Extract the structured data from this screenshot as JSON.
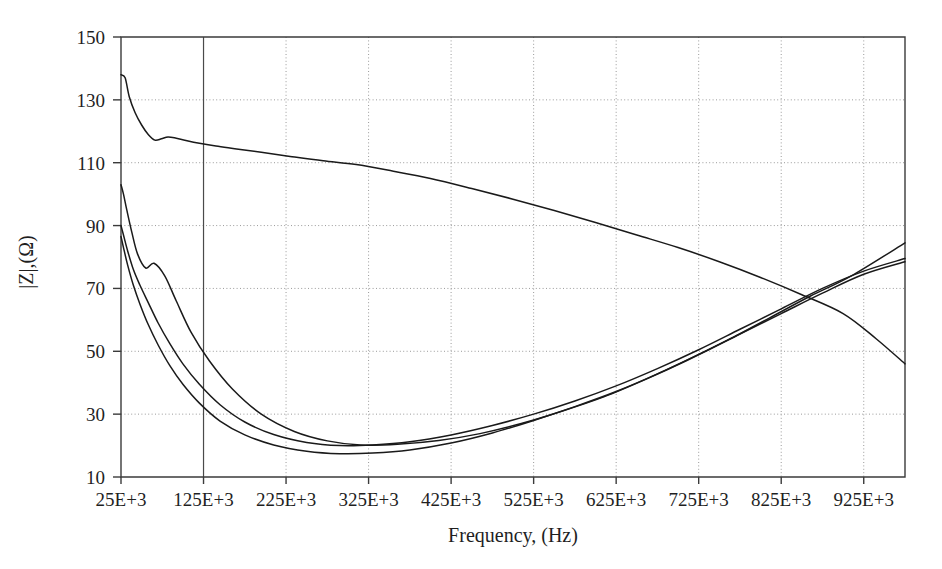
{
  "chart_data": {
    "type": "line",
    "title": "",
    "xlabel": "Frequency, (Hz)",
    "ylabel": "|Z|,(Ω)",
    "xlim": [
      25000,
      975000
    ],
    "ylim": [
      10,
      150
    ],
    "grid": true,
    "legend": "none",
    "x_tick_labels": [
      "25E+3",
      "125E+3",
      "225E+3",
      "325E+3",
      "425E+3",
      "525E+3",
      "625E+3",
      "725E+3",
      "825E+3",
      "925E+3"
    ],
    "x_tick_values": [
      25000,
      125000,
      225000,
      325000,
      425000,
      525000,
      625000,
      725000,
      825000,
      925000
    ],
    "y_tick_labels": [
      "10",
      "30",
      "50",
      "70",
      "90",
      "110",
      "130",
      "150"
    ],
    "y_tick_values": [
      10,
      30,
      50,
      70,
      90,
      110,
      130,
      150
    ],
    "series": [
      {
        "name": "curve-1-monotonic-decreasing",
        "x": [
          25000,
          30000,
          35000,
          42000,
          50000,
          58000,
          66000,
          74000,
          82000,
          92000,
          105000,
          120000,
          140000,
          165000,
          195000,
          230000,
          270000,
          310000,
          355000,
          400000,
          450000,
          500000,
          550000,
          600000,
          650000,
          700000,
          750000,
          800000,
          850000,
          900000,
          940000,
          975000
        ],
        "y": [
          138.0,
          137.0,
          131.0,
          126.0,
          122.0,
          119.0,
          117.2,
          117.6,
          118.2,
          117.8,
          117.0,
          116.2,
          115.3,
          114.4,
          113.3,
          112.0,
          110.6,
          109.4,
          107.3,
          105.0,
          101.8,
          98.4,
          94.8,
          91.0,
          87.0,
          83.0,
          78.5,
          73.5,
          68.0,
          62.0,
          54.0,
          46.0
        ]
      },
      {
        "name": "curve-2-resonant-upper",
        "x": [
          25000,
          28000,
          32000,
          38000,
          45000,
          55000,
          65000,
          78000,
          92000,
          110000,
          132000,
          160000,
          195000,
          235000,
          275000,
          315000,
          360000,
          410000,
          460000,
          510000,
          560000,
          610000,
          660000,
          710000,
          760000,
          810000,
          860000,
          910000,
          975000
        ],
        "y": [
          103.0,
          100.0,
          95.0,
          88.0,
          81.0,
          76.5,
          78.0,
          74.0,
          66.0,
          56.0,
          47.0,
          38.0,
          30.0,
          24.5,
          21.5,
          20.2,
          20.4,
          21.6,
          23.8,
          27.0,
          31.0,
          35.5,
          41.0,
          47.0,
          53.5,
          60.5,
          67.5,
          74.0,
          84.5
        ]
      },
      {
        "name": "curve-3-resonant-middle",
        "x": [
          25000,
          28000,
          33000,
          40000,
          48000,
          58000,
          70000,
          84000,
          100000,
          120000,
          145000,
          175000,
          210000,
          250000,
          290000,
          330000,
          375000,
          425000,
          475000,
          525000,
          575000,
          625000,
          675000,
          725000,
          775000,
          825000,
          875000,
          925000,
          975000
        ],
        "y": [
          90.0,
          87.0,
          82.0,
          76.0,
          71.0,
          65.5,
          59.0,
          52.5,
          46.0,
          39.5,
          33.0,
          27.5,
          23.5,
          21.0,
          20.0,
          20.2,
          21.2,
          23.4,
          26.4,
          30.0,
          34.2,
          39.0,
          44.5,
          50.5,
          57.0,
          63.5,
          70.0,
          75.5,
          79.5
        ]
      },
      {
        "name": "curve-4-resonant-lower",
        "x": [
          25000,
          28000,
          33000,
          40000,
          48000,
          58000,
          70000,
          84000,
          100000,
          120000,
          145000,
          175000,
          210000,
          250000,
          290000,
          330000,
          375000,
          425000,
          475000,
          525000,
          575000,
          625000,
          675000,
          725000,
          775000,
          825000,
          875000,
          925000,
          975000
        ],
        "y": [
          86.5,
          83.0,
          77.5,
          71.0,
          65.0,
          58.5,
          52.0,
          45.5,
          39.5,
          33.5,
          27.8,
          23.4,
          20.2,
          18.2,
          17.4,
          17.6,
          18.6,
          20.8,
          24.0,
          28.0,
          32.4,
          37.2,
          42.8,
          49.0,
          55.5,
          62.0,
          68.5,
          74.5,
          78.5
        ]
      }
    ]
  },
  "plot_geometry": {
    "left": 121,
    "right": 905,
    "top": 37,
    "bottom": 477
  },
  "styles": {
    "curve_color": "#1a1a1a",
    "frame_color": "#3b3b3b",
    "grid_color": "#9a9a9a",
    "background": "#ffffff"
  }
}
